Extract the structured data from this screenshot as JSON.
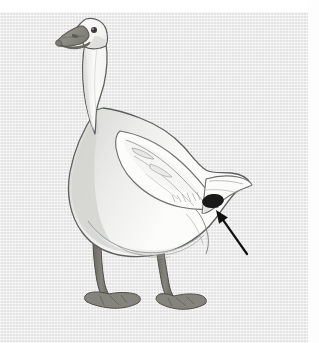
{
  "figure": {
    "kind": "scientific-illustration",
    "view": "standing profile, facing left",
    "medium": "pencil and wash drawing",
    "background_color": "#e9e9e9",
    "margin_color": "#ffffff",
    "width_px": 319,
    "height_px": 343
  },
  "layout": {
    "top_white_band_height_px": 12,
    "right_white_band_width_px": 11,
    "canvas_left_px": 0,
    "canvas_top_px": 12,
    "canvas_width_px": 308,
    "canvas_height_px": 331
  },
  "palette": {
    "background": "#e9e9e9",
    "margin_white": "#ffffff",
    "body_white": "#fbfbfb",
    "body_shadow": "#d9dad6",
    "body_shadow_deep": "#cdcec9",
    "outline": "#5d5f60",
    "outline_soft": "#8a8c8d",
    "beak": "#8b8a84",
    "beak_dark": "#6e6d66",
    "beak_tip": "#7a7973",
    "eye": "#3a3a3a",
    "leg": "#77766f",
    "leg_dark": "#5d5c55",
    "foot": "#82817a",
    "marker_oval": "#1a1a1a",
    "arrow": "#111111"
  },
  "annotations": {
    "marker": {
      "name": "vent-marking-oval",
      "shape": "filled ellipse",
      "color": "#1a1a1a",
      "center_x": 213,
      "center_y": 213,
      "radius_x": 11,
      "radius_y": 7,
      "rotation_deg": -8
    },
    "arrow": {
      "name": "pointer-arrow",
      "color": "#111111",
      "tail_x": 247,
      "tail_y": 266,
      "head_x": 216,
      "head_y": 222,
      "direction": "points up-left toward the dark oval marking",
      "line_width": 2.2
    }
  },
  "anatomy": {
    "parts": [
      {
        "label": "head",
        "x": 78,
        "y": 45
      },
      {
        "label": "beak",
        "x": 60,
        "y": 52
      },
      {
        "label": "eye",
        "x": 88,
        "y": 44
      },
      {
        "label": "neck",
        "x": 95,
        "y": 115
      },
      {
        "label": "breast",
        "x": 90,
        "y": 195
      },
      {
        "label": "wing",
        "x": 160,
        "y": 175
      },
      {
        "label": "back",
        "x": 150,
        "y": 145
      },
      {
        "label": "tail",
        "x": 235,
        "y": 200
      },
      {
        "label": "belly",
        "x": 140,
        "y": 240
      },
      {
        "label": "left-leg",
        "x": 105,
        "y": 280
      },
      {
        "label": "right-leg",
        "x": 165,
        "y": 280
      },
      {
        "label": "left-foot",
        "x": 100,
        "y": 312
      },
      {
        "label": "right-foot",
        "x": 170,
        "y": 315
      }
    ]
  },
  "text": {
    "caption": "",
    "labels": []
  }
}
